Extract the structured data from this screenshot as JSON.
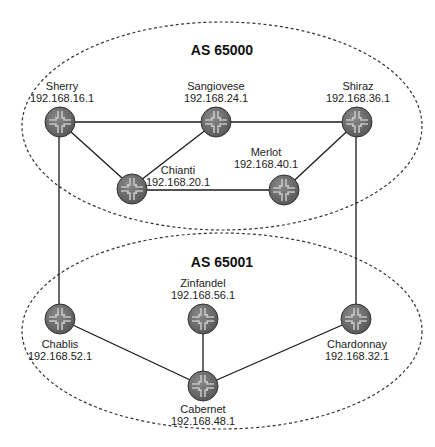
{
  "diagram": {
    "as_groups": [
      {
        "label": "AS 65000"
      },
      {
        "label": "AS 65001"
      }
    ],
    "routers": {
      "sherry": {
        "name": "Sherry",
        "ip": "192.168.16.1"
      },
      "sangiovese": {
        "name": "Sangiovese",
        "ip": "192.168.24.1"
      },
      "shiraz": {
        "name": "Shiraz",
        "ip": "192.168.36.1"
      },
      "chianti": {
        "name": "Chianti",
        "ip": "192.168.20.1"
      },
      "merlot": {
        "name": "Merlot",
        "ip": "192.168.40.1"
      },
      "zinfandel": {
        "name": "Zinfandel",
        "ip": "192.168.56.1"
      },
      "chablis": {
        "name": "Chablis",
        "ip": "192.168.52.1"
      },
      "chardonnay": {
        "name": "Chardonnay",
        "ip": "192.168.32.1"
      },
      "cabernet": {
        "name": "Cabernet",
        "ip": "192.168.48.1"
      }
    },
    "links": [
      [
        "Sherry",
        "Sangiovese"
      ],
      [
        "Sangiovese",
        "Shiraz"
      ],
      [
        "Sherry",
        "Chianti"
      ],
      [
        "Sangiovese",
        "Chianti"
      ],
      [
        "Chianti",
        "Merlot"
      ],
      [
        "Merlot",
        "Shiraz"
      ],
      [
        "Sherry",
        "Chablis"
      ],
      [
        "Shiraz",
        "Chardonnay"
      ],
      [
        "Chablis",
        "Cabernet"
      ],
      [
        "Zinfandel",
        "Cabernet"
      ],
      [
        "Chardonnay",
        "Cabernet"
      ]
    ],
    "colors": {
      "router_fill": "#6e6e6e",
      "router_cross": "#b8b8b8",
      "link": "#1a1a1a",
      "boundary": "#333333"
    }
  }
}
